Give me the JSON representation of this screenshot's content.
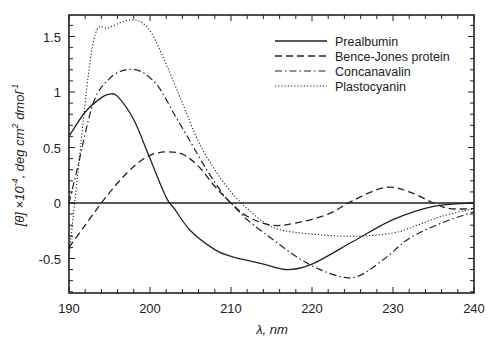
{
  "chart_data": {
    "type": "line",
    "title": "",
    "xlabel": "λ, nm",
    "ylabel": "[θ]×10⁻⁴, deg cm² dmol⁻¹",
    "xlim": [
      190,
      240
    ],
    "ylim": [
      -0.8,
      1.7
    ],
    "xticks": [
      190,
      200,
      210,
      220,
      230,
      240
    ],
    "xtick_labels": [
      "190",
      "200",
      "210",
      "220",
      "230",
      "240"
    ],
    "yticks": [
      -0.5,
      0,
      0.5,
      1,
      1.5
    ],
    "ytick_labels": [
      "-0.5",
      "0",
      "0.5",
      "1",
      "1.5"
    ],
    "grid": false,
    "zero_line": true,
    "legend_position": "upper right",
    "series": [
      {
        "name": "Prealbumin",
        "style": "solid",
        "x": [
          190,
          192,
          194,
          195,
          196,
          198,
          200,
          202,
          203,
          205,
          208,
          210,
          214,
          217,
          220,
          225,
          230,
          235,
          240
        ],
        "y": [
          0.6,
          0.82,
          0.95,
          0.98,
          0.96,
          0.75,
          0.4,
          0.05,
          -0.05,
          -0.25,
          -0.42,
          -0.48,
          -0.55,
          -0.6,
          -0.55,
          -0.35,
          -0.15,
          -0.03,
          0.0
        ]
      },
      {
        "name": "Bence-Jones protein",
        "style": "dashed",
        "x": [
          190,
          192,
          194,
          196,
          198,
          200,
          202,
          204,
          206,
          208,
          210,
          212,
          215,
          218,
          222,
          225,
          229,
          232,
          235,
          237,
          240
        ],
        "y": [
          -0.4,
          -0.2,
          0.0,
          0.18,
          0.33,
          0.43,
          0.46,
          0.44,
          0.33,
          0.15,
          0.0,
          -0.12,
          -0.2,
          -0.18,
          -0.1,
          0.02,
          0.14,
          0.1,
          0.0,
          -0.05,
          -0.05
        ]
      },
      {
        "name": "Concanavalin",
        "style": "dashdot",
        "x": [
          190,
          191,
          193,
          195,
          197,
          199,
          201,
          203,
          205,
          207,
          209,
          210,
          212,
          215,
          218,
          221,
          224,
          226,
          229,
          232,
          236,
          240
        ],
        "y": [
          0.0,
          0.3,
          0.9,
          1.12,
          1.2,
          1.18,
          1.05,
          0.8,
          0.55,
          0.3,
          0.08,
          0.0,
          -0.15,
          -0.32,
          -0.48,
          -0.6,
          -0.67,
          -0.65,
          -0.5,
          -0.32,
          -0.18,
          -0.08
        ]
      },
      {
        "name": "Plastocyanin",
        "style": "dotted",
        "x": [
          190,
          191,
          193,
          195,
          198,
          200,
          202,
          204,
          206,
          208,
          210,
          212,
          214,
          216,
          220,
          225,
          230,
          233,
          236,
          240
        ],
        "y": [
          -0.5,
          0.2,
          1.45,
          1.58,
          1.65,
          1.55,
          1.25,
          0.9,
          0.55,
          0.3,
          0.1,
          -0.05,
          -0.17,
          -0.24,
          -0.28,
          -0.3,
          -0.27,
          -0.2,
          -0.12,
          -0.05
        ]
      }
    ]
  },
  "labels": {
    "xlabel": "λ, nm",
    "ylabel_main": "[θ]",
    "ylabel_times": " ×10",
    "ylabel_exp1": "-4",
    "ylabel_mid": ", deg cm",
    "ylabel_exp2": "2",
    "ylabel_end": " dmol",
    "ylabel_exp3": "-1"
  }
}
